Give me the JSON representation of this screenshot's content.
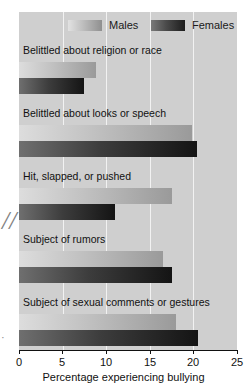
{
  "chart_data": {
    "type": "bar",
    "orientation": "horizontal",
    "title": "",
    "xlabel": "Percentage experiencing bullying",
    "ylabel": "",
    "xlim": [
      0,
      25
    ],
    "xticks": [
      0,
      5,
      10,
      15,
      20,
      25
    ],
    "xticklabels": [
      "0",
      "5",
      "10",
      "15",
      "20",
      "25"
    ],
    "grid": "vertical-white-gridlines",
    "legend_position": "top",
    "categories": [
      "Belittled about religion or race",
      "Belittled about looks or speech",
      "Hit, slapped, or pushed",
      "Subject of rumors",
      "Subject of sexual comments or gestures"
    ],
    "series": [
      {
        "name": "Males",
        "color": "#bdbdbd",
        "values": [
          8.8,
          19.8,
          17.5,
          16.5,
          18.0
        ]
      },
      {
        "name": "Females",
        "color": "#2b2b2b",
        "values": [
          7.4,
          20.4,
          11.0,
          17.5,
          20.5
        ]
      }
    ]
  },
  "legend": {
    "males_label": "Males",
    "females_label": "Females"
  },
  "axis": {
    "xlabel": "Percentage experiencing bullying",
    "tick_0": "0",
    "tick_1": "5",
    "tick_2": "10",
    "tick_3": "15",
    "tick_4": "20",
    "tick_5": "25"
  },
  "annotations": {
    "margin_mark": "//",
    "margin_mark_small": "·"
  }
}
